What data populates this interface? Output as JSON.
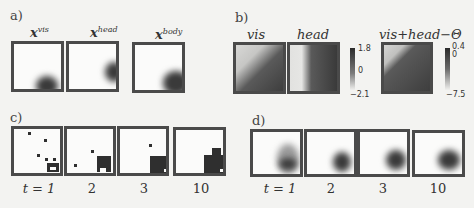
{
  "panels": {
    "a": {
      "label": "a)",
      "titles": [
        "x",
        "x",
        "x"
      ],
      "superscripts": [
        "vis",
        "head",
        "body"
      ]
    },
    "b": {
      "label": "b)",
      "titles": [
        "vis",
        "head",
        "vis+head−Θ"
      ],
      "colorbar1": {
        "max": "1.8",
        "mid": "0",
        "min": "−2.1"
      },
      "colorbar2": {
        "max": "0.4",
        "mid": "0",
        "min": "−7.5"
      }
    },
    "c": {
      "label": "c)",
      "time_labels": [
        "t = 1",
        "2",
        "3",
        "10"
      ]
    },
    "d": {
      "label": "d)",
      "time_labels": [
        "t = 1",
        "2",
        "3",
        "10"
      ]
    }
  }
}
